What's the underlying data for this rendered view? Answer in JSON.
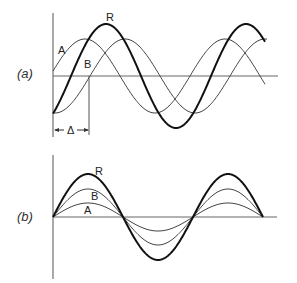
{
  "figure": {
    "panel_a": {
      "label": "(a)",
      "curves": [
        {
          "name": "A",
          "label": "A",
          "amplitude": 37,
          "phase_start_x": 50
        },
        {
          "name": "B",
          "label": "B",
          "amplitude": 37,
          "phase_start_x": 90
        },
        {
          "name": "R",
          "label": "R",
          "amplitude": 52,
          "phase_start_x": 71
        }
      ],
      "delta_label": "Δ"
    },
    "panel_b": {
      "label": "(b)",
      "curves": [
        {
          "name": "A",
          "label": "A",
          "amplitude": 14
        },
        {
          "name": "B",
          "label": "B",
          "amplitude": 28
        },
        {
          "name": "R",
          "label": "R",
          "amplitude": 43
        }
      ]
    },
    "period_px": 140,
    "colors": {
      "thin": "#444444",
      "thick": "#111111",
      "axis": "#555555"
    }
  }
}
